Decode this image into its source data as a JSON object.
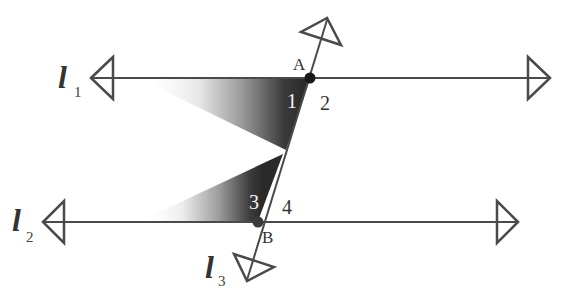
{
  "diagram": {
    "type": "parallel-lines-cut-by-transversal",
    "colors": {
      "line": "#4a4a4a",
      "point": "#1a1a1a",
      "shade_dark": "#2b2b2b",
      "shade_light": "#ffffff",
      "background": "#ffffff"
    },
    "lines": [
      {
        "id": "l1",
        "name": "l",
        "subscript": "1"
      },
      {
        "id": "l2",
        "name": "l",
        "subscript": "2"
      },
      {
        "id": "l3",
        "name": "l",
        "subscript": "3"
      }
    ],
    "points": [
      {
        "id": "A",
        "label": "A"
      },
      {
        "id": "B",
        "label": "B"
      }
    ],
    "angles": [
      {
        "id": "angle-1",
        "label": "1",
        "shaded": true
      },
      {
        "id": "angle-2",
        "label": "2",
        "shaded": false
      },
      {
        "id": "angle-3",
        "label": "3",
        "shaded": true
      },
      {
        "id": "angle-4",
        "label": "4",
        "shaded": false
      }
    ]
  }
}
